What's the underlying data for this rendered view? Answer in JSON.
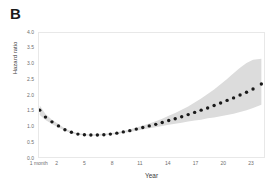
{
  "figure": {
    "panel_label": "B"
  },
  "chart_data": {
    "type": "line",
    "title": "",
    "subtitle": "",
    "xlabel": "Year",
    "ylabel": "Hazard ratio",
    "xlim": [
      0,
      24.5
    ],
    "ylim": [
      0.0,
      4.0
    ],
    "grid": false,
    "legend": null,
    "marker": "filled-circle",
    "marker_color": "#1a1a1a",
    "band_color": "#d9d9d9",
    "band_label": "95% confidence interval",
    "y_ticks": [
      "4.0",
      "3.5",
      "3.0",
      "2.5",
      "2.0",
      "1.5",
      "1.0",
      "0.5",
      "0.0"
    ],
    "y_tick_values": [
      4.0,
      3.5,
      3.0,
      2.5,
      2.0,
      1.5,
      1.0,
      0.5,
      0.0
    ],
    "x_ticks": [
      "1 month",
      "2",
      "5",
      "8",
      "11",
      "14",
      "17",
      "20",
      "23"
    ],
    "x_tick_values": [
      0.083,
      2,
      5,
      8,
      11,
      14,
      17,
      20,
      23
    ],
    "x": [
      0.08,
      0.7,
      1.4,
      2.1,
      2.8,
      3.5,
      4.2,
      4.9,
      5.6,
      6.3,
      7.0,
      7.7,
      8.4,
      9.1,
      9.8,
      10.5,
      11.2,
      11.9,
      12.6,
      13.3,
      14.0,
      14.7,
      15.4,
      16.1,
      16.8,
      17.5,
      18.2,
      18.9,
      19.6,
      20.3,
      21.0,
      21.7,
      22.4,
      23.1,
      24.0
    ],
    "series": [
      {
        "name": "Hazard ratio",
        "values": [
          1.55,
          1.33,
          1.18,
          1.05,
          0.93,
          0.85,
          0.79,
          0.77,
          0.76,
          0.76,
          0.77,
          0.79,
          0.82,
          0.86,
          0.9,
          0.95,
          1.0,
          1.05,
          1.1,
          1.16,
          1.22,
          1.28,
          1.34,
          1.41,
          1.48,
          1.55,
          1.62,
          1.7,
          1.78,
          1.86,
          1.94,
          2.03,
          2.12,
          2.22,
          2.38
        ]
      }
    ],
    "ci_lower": [
      1.4,
      1.24,
      1.11,
      1.0,
      0.9,
      0.82,
      0.77,
      0.75,
      0.74,
      0.74,
      0.75,
      0.77,
      0.79,
      0.83,
      0.86,
      0.9,
      0.94,
      0.98,
      1.01,
      1.05,
      1.09,
      1.12,
      1.15,
      1.19,
      1.22,
      1.25,
      1.29,
      1.32,
      1.36,
      1.4,
      1.44,
      1.49,
      1.55,
      1.62,
      1.72
    ],
    "ci_upper": [
      1.7,
      1.43,
      1.25,
      1.11,
      0.97,
      0.88,
      0.82,
      0.79,
      0.78,
      0.79,
      0.8,
      0.82,
      0.85,
      0.89,
      0.94,
      1.0,
      1.06,
      1.13,
      1.2,
      1.28,
      1.37,
      1.46,
      1.56,
      1.67,
      1.79,
      1.92,
      2.06,
      2.21,
      2.37,
      2.54,
      2.72,
      2.9,
      3.05,
      3.15,
      3.18
    ]
  }
}
